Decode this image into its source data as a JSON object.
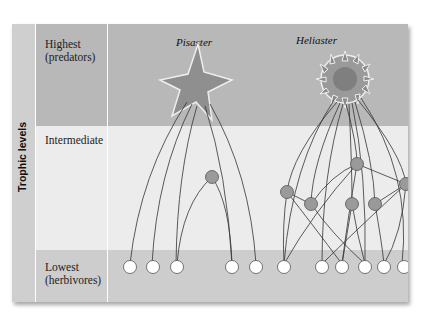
{
  "axis": {
    "label": "Trophic levels"
  },
  "levels": [
    {
      "name": "Highest",
      "sub": "(predators)"
    },
    {
      "name": "Intermediate",
      "sub": ""
    },
    {
      "name": "Lowest",
      "sub": "(herbivores)"
    }
  ],
  "species": {
    "left": "Pisaster",
    "right": "Heliaster"
  },
  "colors": {
    "top_band": "#b8b8b8",
    "mid_band": "#ececec",
    "bottom_band": "#cdcdcd",
    "intermediate_node": "#9a9a9a",
    "herbivore_node": "#ffffff"
  }
}
